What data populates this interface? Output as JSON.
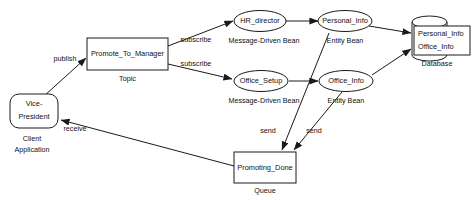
{
  "diagram": {
    "background_color": "#ffffff",
    "stroke_color": "#1a1a1a",
    "nodes": [
      {
        "id": "vice_president",
        "shape": "rounded-rectangle",
        "label_line1": "Vice-",
        "label_line2": "President",
        "sublabel_line1": "Client",
        "sublabel_line2": "Application"
      },
      {
        "id": "promote_to_manager",
        "shape": "rectangle",
        "label": "Promote_To_Manager",
        "sublabel": "Topic"
      },
      {
        "id": "hr_director",
        "shape": "ellipse",
        "label": "HR_director",
        "sublabel": "Message-Driven Bean"
      },
      {
        "id": "office_setup",
        "shape": "ellipse",
        "label": "Office_Setup",
        "sublabel": "Message-Driven Bean"
      },
      {
        "id": "personal_info_bean",
        "shape": "ellipse",
        "label": "Personal_Info",
        "sublabel": "Entity Bean"
      },
      {
        "id": "office_info_bean",
        "shape": "ellipse",
        "label": "Office_Info",
        "sublabel": "Entity Bean"
      },
      {
        "id": "database",
        "shape": "cylinder",
        "label_line1": "Personal_Info",
        "label_line2": "Office_Info",
        "sublabel": "Database"
      },
      {
        "id": "promoting_done",
        "shape": "rectangle",
        "label": "Promoting_Done",
        "sublabel": "Queue"
      }
    ],
    "edges": [
      {
        "id": "publish",
        "from": "vice_president",
        "to": "promote_to_manager",
        "label": "publish"
      },
      {
        "id": "subscribe_hr",
        "from": "promote_to_manager",
        "to": "hr_director",
        "label": "subscribe"
      },
      {
        "id": "subscribe_office",
        "from": "promote_to_manager",
        "to": "office_setup",
        "label": "subscribe"
      },
      {
        "id": "hr_to_personal",
        "from": "hr_director",
        "to": "personal_info_bean",
        "label": ""
      },
      {
        "id": "office_setup_to_office_info",
        "from": "office_setup",
        "to": "office_info_bean",
        "label": ""
      },
      {
        "id": "personal_to_db",
        "from": "personal_info_bean",
        "to": "database",
        "label": ""
      },
      {
        "id": "office_info_to_db",
        "from": "office_info_bean",
        "to": "database",
        "label": ""
      },
      {
        "id": "send_personal",
        "from": "personal_info_bean",
        "to": "promoting_done",
        "label": "send"
      },
      {
        "id": "send_office",
        "from": "office_info_bean",
        "to": "promoting_done",
        "label": "send"
      },
      {
        "id": "receive",
        "from": "promoting_done",
        "to": "vice_president",
        "label": "receive"
      }
    ]
  }
}
